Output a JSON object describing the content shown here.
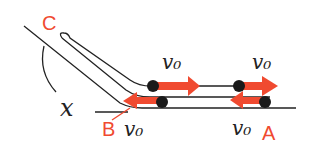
{
  "diagram": {
    "title": "",
    "points": {
      "A": "A",
      "B": "B",
      "C": "C"
    },
    "angle_label": "x",
    "velocity_labels": {
      "upper_left": "v₀",
      "upper_right": "v₀",
      "lower_left": "v₀",
      "lower_right": "v₀"
    },
    "colors": {
      "line": "#222222",
      "arrow": "#f04a30",
      "point_label": "#f04a30",
      "ball": "#1a1a1a"
    }
  }
}
